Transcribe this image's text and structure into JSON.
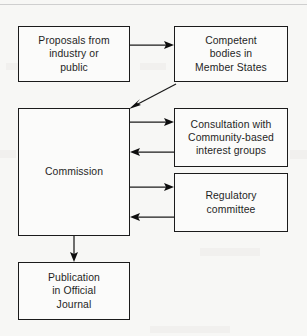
{
  "diagram": {
    "type": "flowchart",
    "colors": {
      "background": "#f7f7f5",
      "box_fill": "#fbfbfa",
      "box_stroke": "#1b1b1b",
      "arrow": "#0e0e0e",
      "text": "#1f1f1f"
    },
    "nodes": [
      {
        "id": "proposals",
        "label": "Proposals from\nindustry or\npublic",
        "x": 18,
        "y": 26,
        "w": 112,
        "h": 56
      },
      {
        "id": "competent-bodies",
        "label": "Competent\nbodies in\nMember States",
        "x": 174,
        "y": 26,
        "w": 114,
        "h": 56
      },
      {
        "id": "commission",
        "label": "Commission",
        "x": 18,
        "y": 108,
        "w": 112,
        "h": 128
      },
      {
        "id": "consultation",
        "label": "Consultation with\nCommunity-based\ninterest groups",
        "x": 174,
        "y": 108,
        "w": 114,
        "h": 59
      },
      {
        "id": "regulatory-committee",
        "label": "Regulatory\ncommittee",
        "x": 174,
        "y": 173,
        "w": 114,
        "h": 59
      },
      {
        "id": "publication",
        "label": "Publication\nin Official\nJournal",
        "x": 18,
        "y": 262,
        "w": 112,
        "h": 58
      }
    ],
    "edges": [
      {
        "id": "proposals-to-competent-bodies",
        "from": "proposals",
        "to": "competent-bodies",
        "shape": "horizontal"
      },
      {
        "id": "competent-bodies-to-commission",
        "from": "competent-bodies",
        "to": "commission",
        "shape": "diagonal"
      },
      {
        "id": "commission-to-consultation",
        "from": "commission",
        "to": "consultation",
        "shape": "horizontal"
      },
      {
        "id": "consultation-to-commission",
        "from": "consultation",
        "to": "commission",
        "shape": "horizontal"
      },
      {
        "id": "commission-to-regulatory-committee",
        "from": "commission",
        "to": "regulatory-committee",
        "shape": "horizontal"
      },
      {
        "id": "regulatory-committee-to-commission",
        "from": "regulatory-committee",
        "to": "commission",
        "shape": "horizontal"
      },
      {
        "id": "commission-to-publication",
        "from": "commission",
        "to": "publication",
        "shape": "vertical"
      }
    ]
  }
}
